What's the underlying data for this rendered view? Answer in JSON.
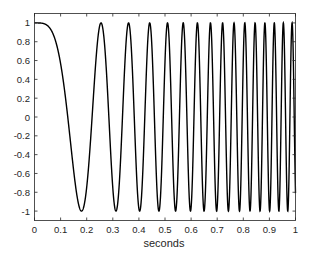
{
  "chart_data": {
    "type": "line",
    "title": "",
    "xlabel": "seconds",
    "ylabel": "",
    "xlim": [
      0,
      1
    ],
    "ylim": [
      -1.1,
      1.1
    ],
    "xticks": [
      "0",
      "0.1",
      "0.2",
      "0.3",
      "0.4",
      "0.5",
      "0.6",
      "0.7",
      "0.8",
      "0.9",
      "1"
    ],
    "yticks": [
      "1",
      "0.8",
      "0.6",
      "0.4",
      "0.2",
      "0",
      "-0.2",
      "-0.4",
      "-0.6",
      "-0.8",
      "-1"
    ],
    "grid": false,
    "legend": null,
    "series": [
      {
        "name": "chirp signal",
        "function": "cos(2*pi*15.4*t^2)",
        "description": "Quadratic-phase chirp starting at 1, first minimum at t≈0.18, peaks at ≈0.255, 0.36, 0.44, ... ~15 oscillations by t=1",
        "key_points": [
          {
            "x": 0.0,
            "y": 1.0
          },
          {
            "x": 0.05,
            "y": 0.93
          },
          {
            "x": 0.1,
            "y": 0.12
          },
          {
            "x": 0.18,
            "y": -1.0
          },
          {
            "x": 0.255,
            "y": 1.0
          },
          {
            "x": 0.312,
            "y": -1.0
          },
          {
            "x": 0.36,
            "y": 1.0
          },
          {
            "x": 0.403,
            "y": -1.0
          },
          {
            "x": 0.441,
            "y": 1.0
          },
          {
            "x": 1.0,
            "y": 0.8
          }
        ],
        "color": "#000000"
      }
    ]
  }
}
